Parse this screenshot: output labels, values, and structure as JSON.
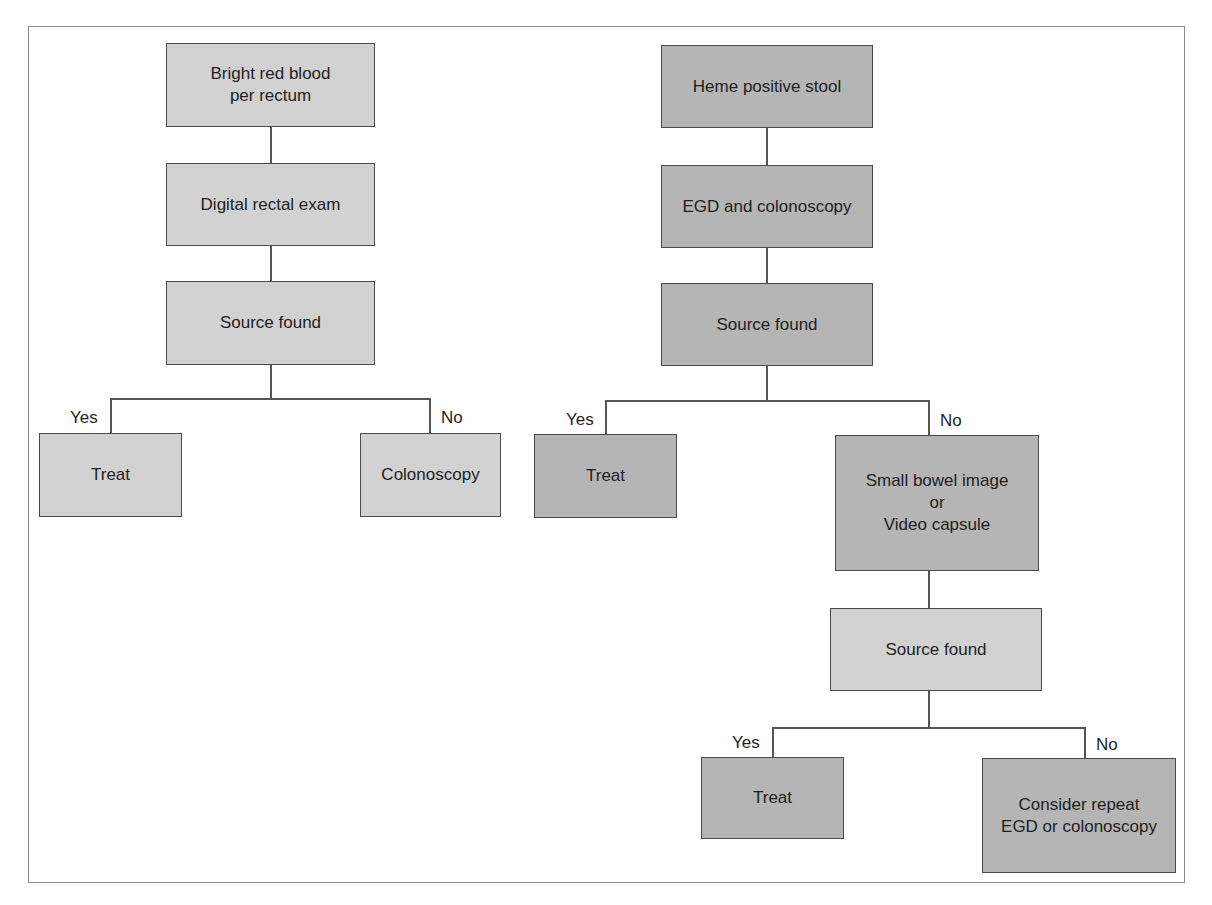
{
  "diagram": {
    "type": "flowchart",
    "left_flow": {
      "start": "Bright red blood\nper rectum",
      "step2": "Digital rectal exam",
      "decision": "Source found",
      "yes_label": "Yes",
      "no_label": "No",
      "yes_outcome": "Treat",
      "no_outcome": "Colonoscopy"
    },
    "right_flow": {
      "start": "Heme positive stool",
      "step2": "EGD and colonoscopy",
      "decision": "Source found",
      "yes_label": "Yes",
      "no_label": "No",
      "yes_outcome": "Treat",
      "no_outcome": "Small bowel image\nor\nVideo capsule",
      "decision2": "Source found",
      "yes2_label": "Yes",
      "no2_label": "No",
      "yes2_outcome": "Treat",
      "no2_outcome": "Consider repeat\nEGD or colonoscopy"
    },
    "colors": {
      "light_fill": "#d2d2d2",
      "dark_fill": "#b5b5b5",
      "border": "#4a4a4a",
      "line": "#555555"
    }
  }
}
